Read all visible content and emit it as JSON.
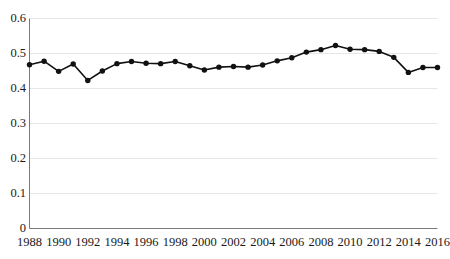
{
  "chart_data": {
    "type": "line",
    "title": "",
    "subtitle": "",
    "xlabel": "",
    "ylabel": "",
    "legend": [],
    "legend_position": "none",
    "grid": true,
    "grid_axis": "y",
    "series_color": "#111111",
    "grid_color": "#e6e6e6",
    "axis_color": "#7a7a7a",
    "marker": "circle",
    "xlim": [
      1988,
      2016
    ],
    "ylim": [
      0,
      0.6
    ],
    "yticks": [
      0,
      0.1,
      0.2,
      0.3,
      0.4,
      0.5,
      0.6
    ],
    "ytick_labels": [
      "0",
      "0.1",
      "0.2",
      "0.3",
      "0.4",
      "0.5",
      "0.6"
    ],
    "xticks": [
      1988,
      1990,
      1992,
      1994,
      1996,
      1998,
      2000,
      2002,
      2004,
      2006,
      2008,
      2010,
      2012,
      2014,
      2016
    ],
    "xtick_labels": [
      "1988",
      "1990",
      "1992",
      "1994",
      "1996",
      "1998",
      "2000",
      "2002",
      "2004",
      "2006",
      "2008",
      "2010",
      "2012",
      "2014",
      "2016"
    ],
    "x": [
      1988,
      1989,
      1990,
      1991,
      1992,
      1993,
      1994,
      1995,
      1996,
      1997,
      1998,
      1999,
      2000,
      2001,
      2002,
      2003,
      2004,
      2005,
      2006,
      2007,
      2008,
      2009,
      2010,
      2011,
      2012,
      2013,
      2014,
      2015,
      2016
    ],
    "values": [
      0.468,
      0.478,
      0.449,
      0.47,
      0.423,
      0.45,
      0.471,
      0.477,
      0.472,
      0.471,
      0.477,
      0.465,
      0.453,
      0.461,
      0.463,
      0.461,
      0.467,
      0.479,
      0.488,
      0.504,
      0.511,
      0.523,
      0.512,
      0.511,
      0.506,
      0.489,
      0.446,
      0.46,
      0.46
    ],
    "series": [
      {
        "name": "series-1",
        "values": [
          0.468,
          0.478,
          0.449,
          0.47,
          0.423,
          0.45,
          0.471,
          0.477,
          0.472,
          0.471,
          0.477,
          0.465,
          0.453,
          0.461,
          0.463,
          0.461,
          0.467,
          0.479,
          0.488,
          0.504,
          0.511,
          0.523,
          0.512,
          0.511,
          0.506,
          0.489,
          0.446,
          0.46,
          0.46
        ]
      }
    ],
    "annotations": []
  }
}
